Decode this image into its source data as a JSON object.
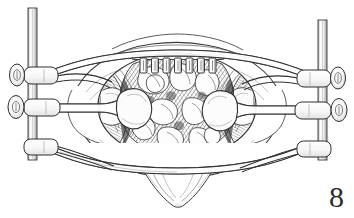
{
  "figure": {
    "number": "8",
    "medium": "pen-and-ink line drawing with cross-hatch shading",
    "background_color": "#ffffff",
    "ink_color": "#2b2b2b",
    "shading_color": "#6f6f6f"
  },
  "canvas": {
    "width": 354,
    "height": 218
  },
  "retractor_system": {
    "name": "frame retractor assembly",
    "posts": [
      {
        "side": "left",
        "label": "left-vertical-post",
        "x": 28,
        "top_y": 8,
        "bottom_y": 158,
        "width": 9
      },
      {
        "side": "right",
        "label": "right-vertical-post",
        "x": 318,
        "top_y": 20,
        "bottom_y": 158,
        "width": 9
      }
    ],
    "clamps": [
      {
        "side": "left",
        "index": 1,
        "y": 75,
        "has_knob": true,
        "knob_shape": "oval-knurled"
      },
      {
        "side": "left",
        "index": 2,
        "y": 106,
        "has_knob": true,
        "knob_shape": "oval-knurled"
      },
      {
        "side": "left",
        "index": 3,
        "y": 146,
        "has_knob": false,
        "knob_shape": "none"
      },
      {
        "side": "right",
        "index": 1,
        "y": 78,
        "has_knob": true,
        "knob_shape": "oval-knurled"
      },
      {
        "side": "right",
        "index": 2,
        "y": 110,
        "has_knob": true,
        "knob_shape": "oval-knurled"
      },
      {
        "side": "right",
        "index": 3,
        "y": 148,
        "has_knob": false,
        "knob_shape": "none"
      }
    ],
    "arms": [
      {
        "label": "upper-left-arm",
        "side": "left",
        "level": "upper"
      },
      {
        "label": "middle-left-arm",
        "side": "left",
        "level": "middle"
      },
      {
        "label": "lower-left-arm",
        "side": "left",
        "level": "lower"
      },
      {
        "label": "upper-right-arm",
        "side": "right",
        "level": "upper"
      },
      {
        "label": "middle-right-arm",
        "side": "right",
        "level": "middle"
      },
      {
        "label": "lower-right-arm",
        "side": "right",
        "level": "lower"
      }
    ],
    "blades": [
      {
        "label": "left-retractor-blade",
        "side": "left",
        "shape": "broad-paddle"
      },
      {
        "label": "right-retractor-blade",
        "side": "right",
        "shape": "broad-paddle"
      }
    ],
    "clip_rows": [
      {
        "label": "upper-clip-row",
        "edge": "top",
        "count": 7,
        "start_x": 140,
        "spacing": 11.5,
        "y": 58,
        "clip_w": 7,
        "clip_h": 15
      },
      {
        "label": "lower-clip-row",
        "edge": "bottom",
        "count": 7,
        "start_x": 140,
        "spacing": 11.5,
        "y": 148,
        "clip_w": 7,
        "clip_h": 14
      }
    ]
  },
  "anatomy": {
    "wound_ring": {
      "label": "circular-wound-opening",
      "cx": 177,
      "cy": 106,
      "rx": 78,
      "ry": 52
    },
    "regions": [
      {
        "label": "exposed-viscera",
        "description": "dense cross-hatched loops of bowel filling the central opening"
      },
      {
        "label": "left-wound-edge-tissue",
        "description": "retracted fascial and muscular wound edge, left"
      },
      {
        "label": "right-wound-edge-tissue",
        "description": "retracted fascial and muscular wound edge, right"
      },
      {
        "label": "upper-abdominal-wall",
        "description": "skin and subcutaneous tissue above the incision"
      },
      {
        "label": "lower-abdominal-wall",
        "description": "skin and subcutaneous tissue below the incision"
      },
      {
        "label": "inferior-soft-tissue",
        "description": "pubic / perineal soft tissue contour below the frame"
      }
    ]
  }
}
